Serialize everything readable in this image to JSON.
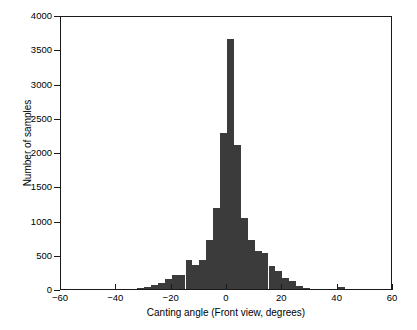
{
  "chart_data": {
    "type": "bar",
    "title": "",
    "subtitle": "",
    "xlabel": "Canting angle (Front view, degrees)",
    "ylabel": "Number of samples",
    "xlim": [
      -60,
      60
    ],
    "ylim": [
      0,
      4000
    ],
    "xticks": [
      -60,
      -40,
      -20,
      0,
      20,
      40,
      60
    ],
    "xtick_labels": [
      "−60",
      "−40",
      "−20",
      "0",
      "20",
      "40",
      "60"
    ],
    "yticks": [
      0,
      500,
      1000,
      1500,
      2000,
      2500,
      3000,
      3500,
      4000
    ],
    "ytick_labels": [
      "0",
      "500",
      "1000",
      "1500",
      "2000",
      "2500",
      "3000",
      "3500",
      "4000"
    ],
    "grid": false,
    "legend": null,
    "bin_width": 2.5,
    "bar_color": "#3b3b3b",
    "axis_color": "#1a1a1a",
    "background": "#ffffff",
    "categories": [
      -31.25,
      -28.75,
      -26.25,
      -23.75,
      -21.25,
      -18.75,
      -16.25,
      -13.75,
      -11.25,
      -8.75,
      -6.25,
      -3.75,
      -1.25,
      1.25,
      3.75,
      6.25,
      8.75,
      11.25,
      13.75,
      16.25,
      18.75,
      21.25,
      23.75,
      26.25,
      28.75,
      41.25
    ],
    "values": [
      15,
      30,
      60,
      95,
      150,
      200,
      210,
      420,
      350,
      430,
      720,
      1180,
      2280,
      3650,
      2100,
      1030,
      720,
      560,
      520,
      330,
      260,
      160,
      120,
      45,
      12,
      25
    ]
  },
  "axis": {
    "xlabel": "Canting angle (Front view, degrees)",
    "ylabel": "Number of samples"
  }
}
